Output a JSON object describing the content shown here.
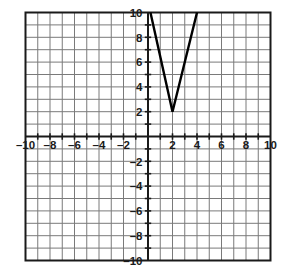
{
  "figure": {
    "title": "",
    "background_color": "#ffffff",
    "grid_color": "#7a7a7a",
    "axis_color": "#1a1a1a",
    "curve_color": "#000000",
    "label_color": "#1a1a1a",
    "minus_sign": "–"
  },
  "chart_data": {
    "type": "line",
    "title": "",
    "xlabel": "",
    "ylabel": "",
    "xlim": [
      -10,
      10
    ],
    "ylim": [
      -10,
      10
    ],
    "grid": true,
    "grid_step": 1,
    "legend": "none",
    "x_tick_labels": [
      "–10",
      "–8",
      "–6",
      "–4",
      "–2",
      "2",
      "4",
      "6",
      "8",
      "10"
    ],
    "x_tick_values": [
      -10,
      -8,
      -6,
      -4,
      -2,
      2,
      4,
      6,
      8,
      10
    ],
    "y_tick_labels": [
      "10",
      "8",
      "6",
      "4",
      "2",
      "–2",
      "–4",
      "–6",
      "–8",
      "–10"
    ],
    "y_tick_values": [
      10,
      8,
      6,
      4,
      2,
      -2,
      -4,
      -6,
      -8,
      -10
    ],
    "series": [
      {
        "name": "v-shape",
        "description": "absolute value function with vertex at (2, 2)",
        "vertex": [
          2,
          2
        ],
        "points": [
          [
            0.2,
            10
          ],
          [
            2,
            2
          ],
          [
            4,
            10
          ]
        ]
      }
    ]
  }
}
